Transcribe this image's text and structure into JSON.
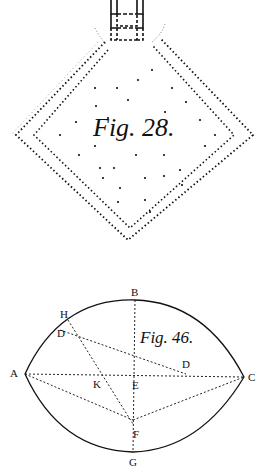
{
  "figures": [
    {
      "id": "fig28",
      "caption": "Fig. 28.",
      "shape": "diamond-with-double-dotted-border-and-tower",
      "dots": [
        [
          152,
          70
        ],
        [
          138,
          80
        ],
        [
          117,
          88
        ],
        [
          95,
          88
        ],
        [
          172,
          88
        ],
        [
          128,
          100
        ],
        [
          186,
          102
        ],
        [
          96,
          106
        ],
        [
          165,
          112
        ],
        [
          108,
          118
        ],
        [
          200,
          120
        ],
        [
          76,
          122
        ],
        [
          60,
          135
        ],
        [
          215,
          135
        ],
        [
          95,
          146
        ],
        [
          205,
          146
        ],
        [
          79,
          155
        ],
        [
          136,
          155
        ],
        [
          164,
          155
        ],
        [
          100,
          168
        ],
        [
          114,
          168
        ],
        [
          180,
          170
        ],
        [
          103,
          178
        ],
        [
          145,
          178
        ],
        [
          164,
          176
        ],
        [
          120,
          188
        ],
        [
          182,
          185
        ],
        [
          118,
          202
        ],
        [
          145,
          200
        ],
        [
          150,
          212
        ]
      ]
    },
    {
      "id": "fig46",
      "caption": "Fig. 46.",
      "shape": "lens",
      "points": {
        "A": {
          "label": "A",
          "x": 24,
          "y": 373
        },
        "B": {
          "label": "B",
          "x": 135,
          "y": 300
        },
        "C": {
          "label": "C",
          "x": 244,
          "y": 377
        },
        "E": {
          "label": "E",
          "x": 134,
          "y": 376
        },
        "F": {
          "label": "F",
          "x": 133,
          "y": 424
        },
        "G": {
          "label": "G",
          "x": 133,
          "y": 452
        },
        "H": {
          "label": "H",
          "x": 68,
          "y": 320
        },
        "D1": {
          "label": "D",
          "x": 59,
          "y": 332
        },
        "D2": {
          "label": "D",
          "x": 186,
          "y": 370
        },
        "K": {
          "label": "K",
          "x": 103,
          "y": 374
        }
      }
    }
  ]
}
